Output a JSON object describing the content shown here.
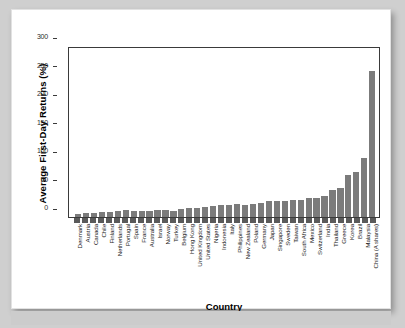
{
  "chart_data": {
    "type": "bar",
    "title": "",
    "xlabel": "Country",
    "ylabel": "Average First-Day Returns (%)",
    "ylim": [
      0,
      300
    ],
    "yticks": [
      0,
      50,
      100,
      150,
      200,
      250,
      300
    ],
    "grid": false,
    "legend": null,
    "bar_color": "#7b7b7b",
    "categories": [
      "Denmark",
      "Austria",
      "Canada",
      "Chile",
      "Finland",
      "Netherlands",
      "Portugal",
      "Spain",
      "France",
      "Australia",
      "Israel",
      "Norway",
      "Turkey",
      "Belgium",
      "Hong Kong",
      "United Kingdom",
      "United States",
      "Nigeria",
      "Indonesia",
      "Italy",
      "Philippines",
      "New Zealand",
      "Poland",
      "Germany",
      "Japan",
      "Singapore",
      "Sweden",
      "Taiwan",
      "South Africa",
      "Mexico",
      "Switzerland",
      "India",
      "Thailand",
      "Greece",
      "Korea",
      "Brazil",
      "Malaysia",
      "China (A shares)"
    ],
    "values": [
      5,
      6.3,
      6.5,
      8.4,
      9.2,
      10.2,
      11.6,
      10.9,
      10.7,
      10.3,
      12.1,
      12.5,
      10.8,
      13.5,
      15.8,
      16.3,
      16.9,
      19.1,
      21.1,
      21.7,
      22.7,
      20.3,
      22.9,
      24.2,
      27.4,
      28.3,
      27.3,
      29.1,
      30.7,
      33.1,
      34.1,
      36.6,
      47.1,
      50.8,
      74.3,
      78.5,
      104.1,
      256.9
    ],
    "max_value": 256.9,
    "bar_count": 43
  },
  "axis": {
    "y_tick_labels": [
      "300",
      "250",
      "200",
      "150",
      "100",
      "50",
      "0"
    ],
    "y_title": "Average First-Day Returns (%)",
    "x_title": "Country"
  }
}
